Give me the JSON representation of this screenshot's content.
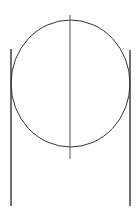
{
  "diagram": {
    "background": "#ffffff",
    "stroke_color": "#333333",
    "circle": {
      "cx": 70.5,
      "cy": 83.5,
      "rx": 59.5,
      "ry": 63.5
    },
    "center_line": {
      "x1": 70,
      "y1": 15,
      "x2": 70,
      "y2": 159
    },
    "left_line": {
      "x1": 11,
      "y1": 49,
      "x2": 11,
      "y2": 206
    },
    "right_line": {
      "x1": 130,
      "y1": 50,
      "x2": 130,
      "y2": 206
    }
  }
}
